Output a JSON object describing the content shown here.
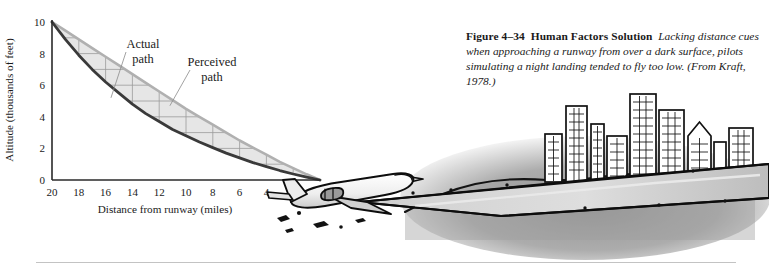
{
  "figure": {
    "caption_label": "Figure 4–34",
    "caption_title": "Human Factors Solution",
    "caption_text": "Lacking distance cues when approaching a runway from over a dark surface, pilots simulating a night landing tended to fly too low. (From Kraft, 1978.)"
  },
  "colors": {
    "actual_path": "#3a3a3a",
    "perceived_path": "#b0b0b0",
    "shaded_region": "#e6e6e6",
    "gridline": "#9a9a9a",
    "axis": "#2a2a2a",
    "text": "#1a1a1a",
    "rule": "#c3c3c3",
    "ink": "#111111",
    "hill": "#8d8d8d"
  },
  "chart_data": {
    "type": "line",
    "title": "",
    "xlabel": "Distance from runway (miles)",
    "ylabel": "Altitude (thousands of feet)",
    "xlim": [
      20,
      0
    ],
    "ylim": [
      0,
      10
    ],
    "x_ticks": [
      "20",
      "18",
      "16",
      "14",
      "12",
      "10",
      "8",
      "6",
      "4",
      "2",
      "0"
    ],
    "y_ticks": [
      "0",
      "2",
      "4",
      "6",
      "8",
      "10"
    ],
    "x_tick_values": [
      20,
      18,
      16,
      14,
      12,
      10,
      8,
      6,
      4,
      2,
      0
    ],
    "y_tick_values": [
      0,
      2,
      4,
      6,
      8,
      10
    ],
    "grid": true,
    "grid_x_values": [
      20,
      18,
      16,
      14,
      12,
      10,
      8,
      6,
      4,
      2,
      0
    ],
    "grid_y_values": [
      1,
      2,
      3,
      4,
      5,
      6,
      7,
      8,
      9
    ],
    "x_axis_reversed": true,
    "legend": "inline-annotations",
    "annotations": [
      {
        "label": "Actual\npath",
        "label_line1": "Actual",
        "label_line2": "path",
        "target_series": "Actual path"
      },
      {
        "label": "Perceived\npath",
        "label_line1": "Perceived",
        "label_line2": "path",
        "target_series": "Perceived path"
      }
    ],
    "series": [
      {
        "name": "Actual path",
        "color": "#3a3a3a",
        "x": [
          20,
          19,
          18,
          17,
          16,
          15,
          14,
          13,
          12,
          11,
          10,
          9,
          8,
          7,
          6,
          5,
          4,
          3,
          2,
          1,
          0
        ],
        "values": [
          10.0,
          8.9,
          7.9,
          7.0,
          6.2,
          5.5,
          4.8,
          4.2,
          3.7,
          3.2,
          2.8,
          2.4,
          2.05,
          1.7,
          1.4,
          1.1,
          0.85,
          0.6,
          0.38,
          0.18,
          0.0
        ]
      },
      {
        "name": "Perceived path",
        "color": "#b0b0b0",
        "x": [
          20,
          19,
          18,
          17,
          16,
          15,
          14,
          13,
          12,
          11,
          10,
          9,
          8,
          7,
          6,
          5,
          4,
          3,
          2,
          1,
          0
        ],
        "values": [
          10.0,
          9.45,
          8.9,
          8.35,
          7.8,
          7.25,
          6.7,
          6.15,
          5.6,
          5.05,
          4.5,
          4.0,
          3.5,
          3.0,
          2.5,
          2.05,
          1.6,
          1.15,
          0.75,
          0.36,
          0.0
        ]
      }
    ]
  },
  "illustration": {
    "name": "night-landing-scene",
    "elements": [
      {
        "name": "airplane",
        "description": "airliner in landing attitude, line art"
      },
      {
        "name": "runway",
        "description": "long perspective runway wedge with edge lights"
      },
      {
        "name": "hill",
        "description": "dark shaded hillside"
      },
      {
        "name": "city-skyline",
        "description": "cluster of high-rise buildings with windows"
      }
    ]
  }
}
